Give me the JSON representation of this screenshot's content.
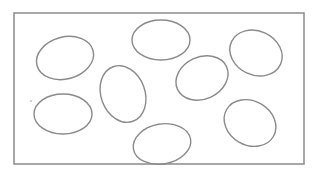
{
  "diagram": {
    "type": "shapes-in-rectangle",
    "stroke_color": "#8a8a8a",
    "background": "#ffffff",
    "frame": {
      "x": 14,
      "y": 13,
      "width": 139,
      "height": 73
    },
    "frame_px": {
      "x": 14,
      "y": 13,
      "width": 290,
      "height": 151
    },
    "ellipses": [
      {
        "id": 1,
        "cx": 65,
        "cy": 58,
        "rx": 29,
        "ry": 21,
        "rotate": -15
      },
      {
        "id": 2,
        "cx": 161,
        "cy": 40,
        "rx": 29,
        "ry": 20,
        "rotate": 0
      },
      {
        "id": 3,
        "cx": 256,
        "cy": 53,
        "rx": 27,
        "ry": 22,
        "rotate": 25
      },
      {
        "id": 4,
        "cx": 123,
        "cy": 94,
        "rx": 22,
        "ry": 29,
        "rotate": -20
      },
      {
        "id": 5,
        "cx": 202,
        "cy": 78,
        "rx": 27,
        "ry": 21,
        "rotate": -25
      },
      {
        "id": 6,
        "cx": 63,
        "cy": 114,
        "rx": 29,
        "ry": 20,
        "rotate": 0
      },
      {
        "id": 7,
        "cx": 162,
        "cy": 144,
        "rx": 29,
        "ry": 20,
        "rotate": -10
      },
      {
        "id": 8,
        "cx": 250,
        "cy": 123,
        "rx": 27,
        "ry": 22,
        "rotate": 30
      }
    ],
    "stray_dot": {
      "x": 31,
      "y": 101
    }
  }
}
